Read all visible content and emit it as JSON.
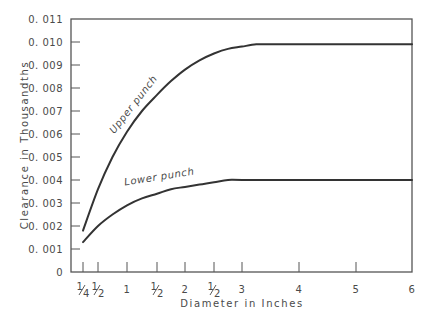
{
  "chart_data": {
    "type": "line",
    "title": "",
    "xlabel": "Diameter in Inches",
    "ylabel": "Clearance in Thousandths",
    "xlim": [
      0,
      6
    ],
    "ylim": [
      0,
      0.011
    ],
    "grid": false,
    "legend": "inline curve labels",
    "x_ticks": [
      {
        "value": 0.25,
        "label": "1/4"
      },
      {
        "value": 0.5,
        "label": "1/2"
      },
      {
        "value": 1,
        "label": "1"
      },
      {
        "value": 1.5,
        "label": "1/2"
      },
      {
        "value": 2,
        "label": "2"
      },
      {
        "value": 2.5,
        "label": "1/2"
      },
      {
        "value": 3,
        "label": "3"
      },
      {
        "value": 4,
        "label": "4"
      },
      {
        "value": 5,
        "label": "5"
      },
      {
        "value": 6,
        "label": "6"
      }
    ],
    "y_ticks": [
      {
        "value": 0,
        "label": "0"
      },
      {
        "value": 0.001,
        "label": "0. 001"
      },
      {
        "value": 0.002,
        "label": "0. 002"
      },
      {
        "value": 0.003,
        "label": "0. 003"
      },
      {
        "value": 0.004,
        "label": "0. 004"
      },
      {
        "value": 0.005,
        "label": "0. 005"
      },
      {
        "value": 0.006,
        "label": "0. 006"
      },
      {
        "value": 0.007,
        "label": "0. 007"
      },
      {
        "value": 0.008,
        "label": "0. 008"
      },
      {
        "value": 0.009,
        "label": "0. 009"
      },
      {
        "value": 0.01,
        "label": "0. 010"
      },
      {
        "value": 0.011,
        "label": "0. 011"
      }
    ],
    "series": [
      {
        "name": "Upper punch",
        "x": [
          0.25,
          0.5,
          0.75,
          1.0,
          1.25,
          1.5,
          1.75,
          2.0,
          2.25,
          2.5,
          2.75,
          3.0,
          3.25,
          3.5,
          4.0,
          5.0,
          6.0
        ],
        "values": [
          0.0018,
          0.0036,
          0.005,
          0.0061,
          0.007,
          0.0077,
          0.0083,
          0.0088,
          0.0092,
          0.0095,
          0.0097,
          0.0098,
          0.0099,
          0.0099,
          0.0099,
          0.0099,
          0.0099
        ]
      },
      {
        "name": "Lower punch",
        "x": [
          0.25,
          0.5,
          0.75,
          1.0,
          1.25,
          1.5,
          1.75,
          2.0,
          2.25,
          2.5,
          2.75,
          3.0,
          4.0,
          5.0,
          6.0
        ],
        "values": [
          0.0013,
          0.002,
          0.0025,
          0.0029,
          0.0032,
          0.0034,
          0.0036,
          0.0037,
          0.0038,
          0.0039,
          0.004,
          0.004,
          0.004,
          0.004,
          0.004
        ]
      }
    ],
    "annotations": [
      {
        "text": "Upper punch",
        "x": 1.15,
        "y": 0.0072
      },
      {
        "text": "Lower punch",
        "x": 1.55,
        "y": 0.004
      }
    ]
  },
  "colors": {
    "line": "#333333",
    "axis": "#555555",
    "text": "#4a4a4a",
    "background": "#ffffff"
  }
}
